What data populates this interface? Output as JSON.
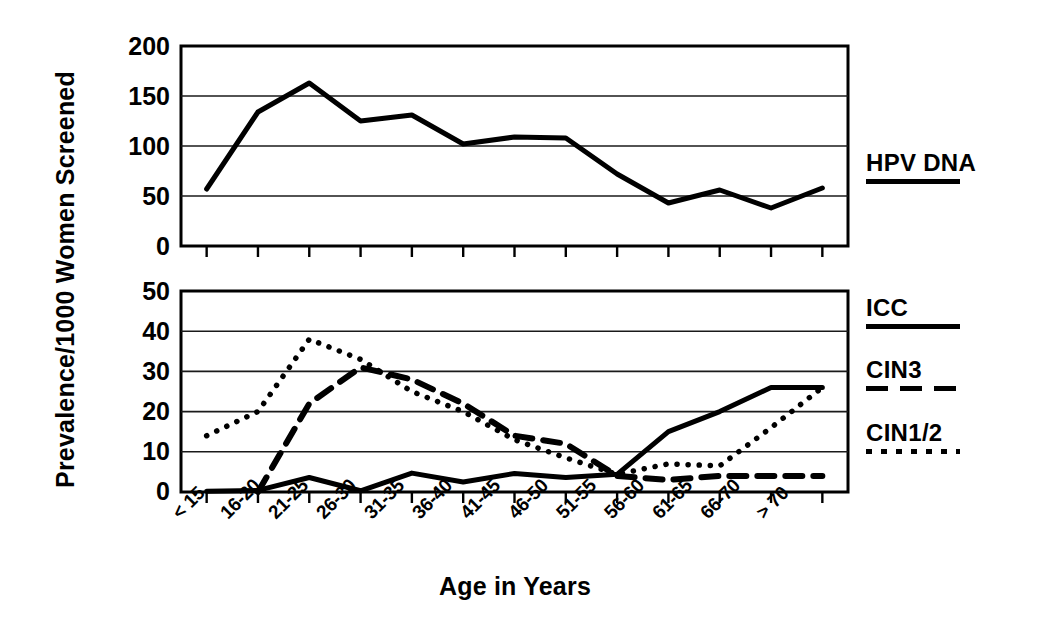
{
  "figure": {
    "ylabel": "Prevalence/1000 Women Screened",
    "xlabel": "Age in Years"
  },
  "legend": {
    "top": [
      {
        "label": "HPV DNA",
        "style": "solid"
      }
    ],
    "bottom": [
      {
        "label": "ICC",
        "style": "solid"
      },
      {
        "label": "CIN3",
        "style": "dashed"
      },
      {
        "label": "CIN1/2",
        "style": "dotted"
      }
    ]
  },
  "axes": {
    "top_yticks": [
      "200",
      "150",
      "100",
      "50",
      "0"
    ],
    "bottom_yticks": [
      "50",
      "40",
      "30",
      "20",
      "10",
      "0"
    ],
    "xticks": [
      "< 15",
      "16-20",
      "21-25",
      "26-30",
      "31-35",
      "36-40",
      "41-45",
      "46-50",
      "51-55",
      "56-60",
      "61-65",
      "66-70",
      "> 70"
    ]
  },
  "chart_data": [
    {
      "type": "line",
      "title": "",
      "xlabel": "Age in Years",
      "ylabel": "Prevalence/1000 Women Screened",
      "ylim": [
        0,
        200
      ],
      "ytick_values": [
        0,
        50,
        100,
        150,
        200
      ],
      "grid": true,
      "legend_position": "right",
      "categories": [
        "< 15",
        "16-20",
        "21-25",
        "26-30",
        "31-35",
        "36-40",
        "41-45",
        "46-50",
        "51-55",
        "56-60",
        "61-65",
        "66-70",
        "> 70"
      ],
      "series": [
        {
          "name": "HPV DNA",
          "style": "solid",
          "values": [
            57,
            134,
            163,
            125,
            131,
            102,
            109,
            108,
            72,
            43,
            56,
            38,
            58
          ]
        }
      ]
    },
    {
      "type": "line",
      "title": "",
      "xlabel": "Age in Years",
      "ylabel": "Prevalence/1000 Women Screened",
      "ylim": [
        0,
        50
      ],
      "ytick_values": [
        0,
        10,
        20,
        30,
        40,
        50
      ],
      "grid": true,
      "legend_position": "right",
      "categories": [
        "< 15",
        "16-20",
        "21-25",
        "26-30",
        "31-35",
        "36-40",
        "41-45",
        "46-50",
        "51-55",
        "56-60",
        "61-65",
        "66-70",
        "> 70"
      ],
      "series": [
        {
          "name": "ICC",
          "style": "solid",
          "values": [
            0.2,
            0.4,
            3.6,
            0.3,
            4.7,
            2.5,
            4.6,
            3.6,
            4.4,
            15,
            20,
            26,
            26
          ]
        },
        {
          "name": "CIN3",
          "style": "dashed",
          "values": [
            null,
            0,
            22,
            31,
            28,
            22,
            14,
            12,
            4,
            3,
            4,
            4,
            4
          ]
        },
        {
          "name": "CIN1/2",
          "style": "dotted",
          "values": [
            14,
            20,
            38,
            33,
            25,
            20,
            13,
            8.5,
            4.4,
            7,
            6.5,
            16,
            26
          ]
        }
      ]
    }
  ]
}
